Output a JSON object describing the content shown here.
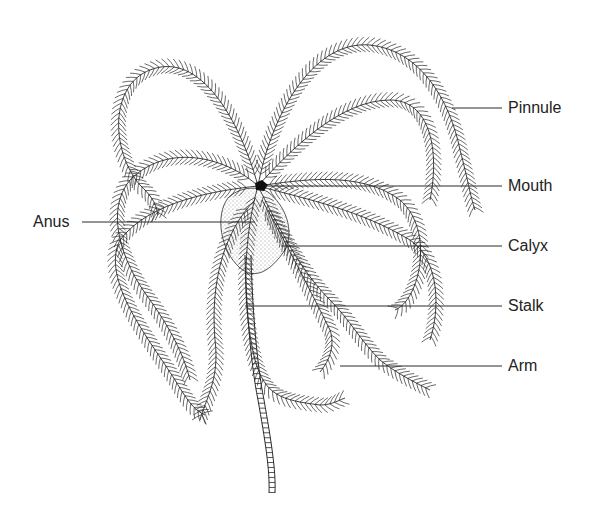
{
  "diagram": {
    "colors": {
      "ink": "#2a2a2a",
      "background": "#ffffff",
      "stipple": "#9a9a9a"
    },
    "labels": [
      {
        "id": "pinnule",
        "text": "Pinnule",
        "x": 508,
        "y": 100,
        "line": [
          452,
          108,
          502,
          108
        ]
      },
      {
        "id": "mouth",
        "text": "Mouth",
        "x": 508,
        "y": 178,
        "line": [
          265,
          186,
          502,
          186
        ]
      },
      {
        "id": "anus",
        "text": "Anus",
        "x": 33,
        "y": 214,
        "line": [
          82,
          222,
          255,
          222
        ]
      },
      {
        "id": "calyx",
        "text": "Calyx",
        "x": 508,
        "y": 238,
        "line": [
          282,
          246,
          502,
          246
        ]
      },
      {
        "id": "stalk",
        "text": "Stalk",
        "x": 508,
        "y": 298,
        "line": [
          245,
          306,
          502,
          306
        ]
      },
      {
        "id": "arm",
        "text": "Arm",
        "x": 508,
        "y": 358,
        "line": [
          340,
          366,
          502,
          366
        ]
      }
    ]
  }
}
